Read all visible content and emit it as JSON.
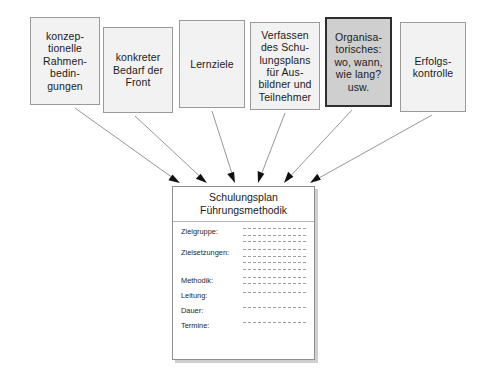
{
  "diagram": {
    "title_hidden": "",
    "top_boxes": [
      {
        "id": "konzeptionelle-rahmenbedingungen",
        "text": "konzep-\ntionelle\nRahmen-\nbedin-\ngungen",
        "highlight": false,
        "x": 30,
        "y": 17,
        "w": 70,
        "h": 88
      },
      {
        "id": "konkreter-bedarf-der-front",
        "text": "konkreter\nBedarf der\nFront",
        "highlight": false,
        "x": 103,
        "y": 27,
        "w": 70,
        "h": 86
      },
      {
        "id": "lernziele",
        "text": "Lernziele",
        "highlight": false,
        "x": 179,
        "y": 20,
        "w": 66,
        "h": 88
      },
      {
        "id": "verfassen-des-schulungsplans",
        "text": "Verfassen\ndes Schu-\nlungsplans\nfür Aus-\nbildner und\nTeilnehmer",
        "highlight": false,
        "x": 250,
        "y": 22,
        "w": 70,
        "h": 88
      },
      {
        "id": "organisatorisches",
        "text": "Organisa-\ntorisches:\nwo, wann,\nwie lang?\nusw.",
        "highlight": true,
        "x": 325,
        "y": 17,
        "w": 67,
        "h": 90
      },
      {
        "id": "erfolgskontrolle",
        "text": "Erfolgs-\nkontrolle",
        "highlight": false,
        "x": 400,
        "y": 22,
        "w": 66,
        "h": 90
      }
    ],
    "arrows": [
      {
        "id": "arrow-from-konzeptionelle",
        "x1": 75,
        "y1": 108,
        "x2": 180,
        "y2": 183
      },
      {
        "id": "arrow-from-konkreter-bedarf",
        "x1": 135,
        "y1": 116,
        "x2": 207,
        "y2": 183
      },
      {
        "id": "arrow-from-lernziele",
        "x1": 212,
        "y1": 111,
        "x2": 235,
        "y2": 183
      },
      {
        "id": "arrow-from-verfassen",
        "x1": 285,
        "y1": 113,
        "x2": 258,
        "y2": 183
      },
      {
        "id": "arrow-from-organisatorisches",
        "x1": 352,
        "y1": 110,
        "x2": 284,
        "y2": 183
      },
      {
        "id": "arrow-from-erfolgskontrolle",
        "x1": 432,
        "y1": 115,
        "x2": 310,
        "y2": 183
      }
    ],
    "form": {
      "title": "Schulungsplan\nFührungsmethodik",
      "rows": [
        {
          "label": "Zielgruppe:",
          "lines": 3
        },
        {
          "label": "Zielsetzungen:",
          "lines": 4
        },
        {
          "label": "Methodik:",
          "lines": 2
        },
        {
          "label": "Leitung:",
          "lines": 1
        },
        {
          "label": "Dauer:",
          "lines": 1
        },
        {
          "label": "Termine:",
          "lines": 1
        }
      ]
    },
    "colors": {
      "box_fill": "#f2f2f2",
      "box_border": "#9a9a9a",
      "highlight_fill": "#cfcfcf",
      "highlight_border": "#2e2e2e",
      "arrow": "#8a8a8a",
      "arrow_head": "#111111",
      "line": "#9d9d9d",
      "text": "#1b1b1b",
      "background": "#ffffff"
    }
  }
}
